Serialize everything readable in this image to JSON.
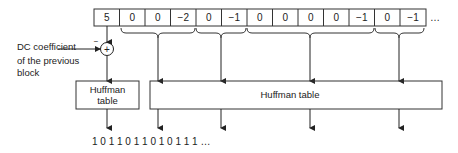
{
  "coefficients": [
    "5",
    "0",
    "0",
    "−2",
    "0",
    "−1",
    "0",
    "0",
    "0",
    "0",
    "−1",
    "0",
    "−1"
  ],
  "coefficients_ellipsis": "…",
  "dc_label": {
    "line1": "DC coefficient",
    "line2": "of the previous",
    "line3": "block"
  },
  "minus_sign": "−",
  "plus_sign": "+",
  "dc_huffman": {
    "line1": "Huffman",
    "line2": "table"
  },
  "ac_huffman": "Huffman table",
  "bitstream": "1 0 1 1 0 1 1 0 1 0 1 1 1 …"
}
